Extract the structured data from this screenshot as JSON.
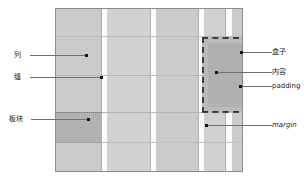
{
  "diagram": {
    "canvas": {
      "fill": "#c9c9c9",
      "border": "#8d8d8d"
    },
    "colors": {
      "column": "#c6c6c6",
      "column_light": "#cdcdcd",
      "gutter": "#fdfdfd",
      "block_highlight": "#aaaaaa",
      "box_padding_fill": "#b4b4b4",
      "box_content_fill": "#a9a9a9",
      "dash_stroke": "#2b2b2b",
      "leader": "#6f6f6f",
      "rule": "#a8a8a8",
      "label_text": "#1a1a1a"
    },
    "columns_count": 5,
    "rows_count": 4
  },
  "labels": {
    "left": [
      {
        "id": "column",
        "text": "列"
      },
      {
        "id": "gutter",
        "text": "缝"
      },
      {
        "id": "block",
        "text": "板块"
      }
    ],
    "right": [
      {
        "id": "box",
        "text": "盒子"
      },
      {
        "id": "content",
        "text": "内容"
      },
      {
        "id": "padding",
        "text": "padding"
      },
      {
        "id": "margin",
        "text": "margin"
      }
    ]
  }
}
